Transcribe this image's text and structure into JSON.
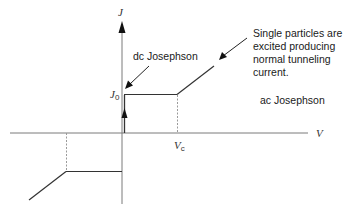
{
  "diagram": {
    "axes": {
      "y_label": "J",
      "x_label": "V"
    },
    "levels": {
      "j0_label_main": "J",
      "j0_label_sub": "0",
      "vc_label_main": "V",
      "vc_label_sub": "c"
    },
    "annotations": {
      "dc": "dc Josephson",
      "single_particles": [
        "Single particles are",
        "excited producing",
        "normal tunneling",
        "current."
      ],
      "ac": "ac Josephson"
    },
    "colors": {
      "axis": "#7a7a7a",
      "curve": "#333333",
      "dashed": "#9a9a9a",
      "text": "#1a1a1a"
    }
  }
}
